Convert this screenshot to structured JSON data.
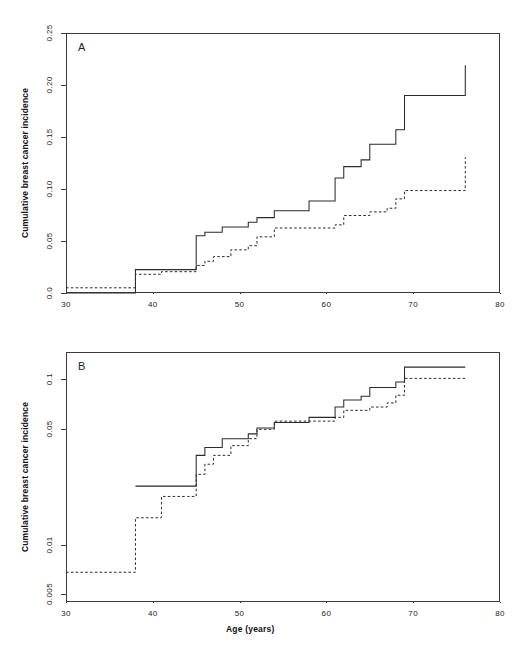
{
  "figure": {
    "width": 517,
    "height": 650,
    "background": "#ffffff",
    "line_color": "#2b2b2b",
    "axis_color": "#3a3a3a"
  },
  "axis_titles": {
    "x": "Age (years)",
    "y": "Cumulative breast cancer incidence"
  },
  "panels": {
    "a": {
      "letter": "A"
    },
    "b": {
      "letter": "B"
    }
  },
  "chart_data": [
    {
      "type": "line",
      "panel": "A",
      "title": "A",
      "subtitle": "",
      "xlabel": "Age (years)",
      "ylabel": "Cumulative breast cancer incidence",
      "xlim": [
        30,
        80
      ],
      "ylim": [
        0.0,
        0.25
      ],
      "yscale": "linear",
      "xscale": "linear",
      "grid": false,
      "legend": "none",
      "xticks": [
        30,
        40,
        50,
        60,
        70,
        80
      ],
      "xtick_labels": [
        "30",
        "40",
        "50",
        "60",
        "70",
        "80"
      ],
      "yticks": [
        0.0,
        0.05,
        0.1,
        0.15,
        0.2,
        0.25
      ],
      "ytick_labels": [
        "0.0",
        "0.05",
        "0.10",
        "0.15",
        "0.20",
        "0.25"
      ],
      "drawstyle": "steps-post",
      "series": [
        {
          "name": "solid-curve",
          "linestyle": "solid",
          "x": [
            30,
            38,
            44,
            45,
            46,
            48,
            51,
            52,
            54,
            58,
            61,
            62,
            64,
            65,
            68,
            69,
            76
          ],
          "values": [
            0.0,
            0.0225,
            0.0225,
            0.055,
            0.0585,
            0.0635,
            0.068,
            0.0725,
            0.079,
            0.0885,
            0.1105,
            0.1215,
            0.128,
            0.143,
            0.157,
            0.19,
            0.219
          ]
        },
        {
          "name": "dashed-curve",
          "linestyle": "dashed",
          "x": [
            30,
            37,
            38,
            41,
            44,
            45,
            46,
            47,
            49,
            51,
            52,
            54,
            61,
            62,
            65,
            67,
            68,
            69,
            76
          ],
          "values": [
            0.005,
            0.005,
            0.018,
            0.0205,
            0.0205,
            0.0265,
            0.0305,
            0.035,
            0.0415,
            0.0455,
            0.054,
            0.0625,
            0.0655,
            0.0745,
            0.078,
            0.0815,
            0.0905,
            0.0985,
            0.1305
          ]
        }
      ],
      "final_values": {
        "solid": 0.219,
        "dashed": 0.157
      }
    },
    {
      "type": "line",
      "panel": "B",
      "title": "B",
      "subtitle": "",
      "xlabel": "Age (years)",
      "ylabel": "Cumulative breast cancer incidence",
      "xlim": [
        30,
        80
      ],
      "ylim": [
        0.0045,
        0.145
      ],
      "yscale": "log",
      "xscale": "linear",
      "grid": false,
      "legend": "none",
      "xticks": [
        30,
        40,
        50,
        60,
        70,
        80
      ],
      "xtick_labels": [
        "30",
        "40",
        "50",
        "60",
        "70",
        "80"
      ],
      "yticks": [
        0.005,
        0.01,
        0.05,
        0.1
      ],
      "ytick_labels": [
        "0.005",
        "0.01",
        "0.05",
        "0.1"
      ],
      "drawstyle": "steps-post",
      "series": [
        {
          "name": "solid-curve",
          "linestyle": "solid",
          "x": [
            38,
            44,
            45,
            46,
            48,
            51,
            52,
            54,
            58,
            61,
            62,
            64,
            65,
            68,
            69,
            76
          ],
          "values": [
            0.0225,
            0.0225,
            0.0345,
            0.0385,
            0.0435,
            0.0465,
            0.0505,
            0.0545,
            0.0585,
            0.0675,
            0.0745,
            0.0785,
            0.0885,
            0.0955,
            0.1175,
            0.1175
          ]
        },
        {
          "name": "dashed-curve",
          "linestyle": "dashed",
          "x": [
            30,
            37,
            38,
            41,
            44,
            45,
            46,
            47,
            49,
            51,
            52,
            54,
            61,
            62,
            65,
            67,
            68,
            69,
            76
          ],
          "values": [
            0.0068,
            0.0068,
            0.0145,
            0.0195,
            0.0195,
            0.0265,
            0.0305,
            0.0345,
            0.0395,
            0.0435,
            0.0495,
            0.0555,
            0.0585,
            0.0645,
            0.0675,
            0.0715,
            0.0795,
            0.1005,
            0.1005
          ]
        }
      ],
      "final_values": {
        "solid": 0.1175,
        "dashed": 0.1065
      }
    }
  ]
}
